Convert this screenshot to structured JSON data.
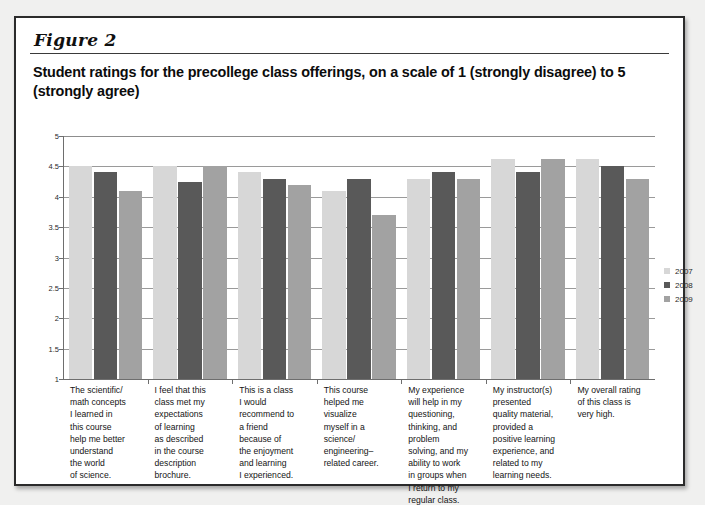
{
  "figure": {
    "label": "Figure 2",
    "title": "Student ratings for the precollege class offerings, on a scale of 1 (strongly disagree) to 5 (strongly agree)"
  },
  "chart_data": {
    "type": "bar",
    "title": "Student ratings for the precollege class offerings, on a scale of 1 (strongly disagree) to 5 (strongly agree)",
    "xlabel": "",
    "ylabel": "",
    "ylim": [
      1,
      5
    ],
    "ytick_labels": [
      "5",
      "4.5",
      "4",
      "3.5",
      "3",
      "2.5",
      "2",
      "1.5",
      "1"
    ],
    "ytick_values": [
      5,
      4.5,
      4,
      3.5,
      3,
      2.5,
      2,
      1.5,
      1
    ],
    "grid": true,
    "legend_position": "right",
    "categories": [
      "The scientific/ math concepts I learned in this course help me better understand the world of science.",
      "I feel that this class met my expectations of learning as described in the course description brochure.",
      "This is a class I would recommend to a friend because of the enjoyment and learning I experienced.",
      "This course helped me visualize myself in a science/ engineering–related career.",
      "My experience will help in my questioning, thinking, and problem solving, and my ability to work in groups when I return to my regular class.",
      "My instructor(s) presented quality material, provided a positive learning experience, and related to my learning needs.",
      "My overall rating of this class is very high."
    ],
    "category_lines": [
      [
        "The scientific/",
        "math concepts",
        "I learned in",
        "this course",
        "help me better",
        "understand",
        "the world",
        "of science."
      ],
      [
        "I feel that this",
        "class met my",
        "expectations",
        "of learning",
        "as described",
        "in the course",
        "description",
        "brochure."
      ],
      [
        "This is a class",
        "I would",
        "recommend to",
        "a friend",
        "because of",
        "the enjoyment",
        "and learning",
        "I experienced."
      ],
      [
        "This course",
        "helped me",
        "visualize",
        "myself in a",
        "science/",
        "engineering–",
        "related career."
      ],
      [
        "My experience",
        "will help in my",
        "questioning,",
        "thinking, and",
        "problem",
        "solving, and my",
        "ability to work",
        "in groups when",
        "I return to my",
        "regular class."
      ],
      [
        "My instructor(s)",
        "presented",
        "quality material,",
        "provided a",
        "positive learning",
        "experience, and",
        "related to my",
        "learning needs."
      ],
      [
        "My overall rating",
        "of this class is",
        "very high."
      ]
    ],
    "series": [
      {
        "name": "2007",
        "color": "#d7d7d7",
        "values": [
          4.5,
          4.5,
          4.4,
          4.1,
          4.3,
          4.62,
          4.62
        ]
      },
      {
        "name": "2008",
        "color": "#595959",
        "values": [
          4.4,
          4.25,
          4.3,
          4.3,
          4.4,
          4.4,
          4.5
        ]
      },
      {
        "name": "2009",
        "color": "#a2a2a2",
        "values": [
          4.1,
          4.5,
          4.2,
          3.7,
          4.3,
          4.62,
          4.3
        ]
      }
    ]
  },
  "legend": {
    "items": [
      {
        "label": "2007",
        "color": "#d7d7d7"
      },
      {
        "label": "2008",
        "color": "#595959"
      },
      {
        "label": "2009",
        "color": "#a2a2a2"
      }
    ]
  }
}
